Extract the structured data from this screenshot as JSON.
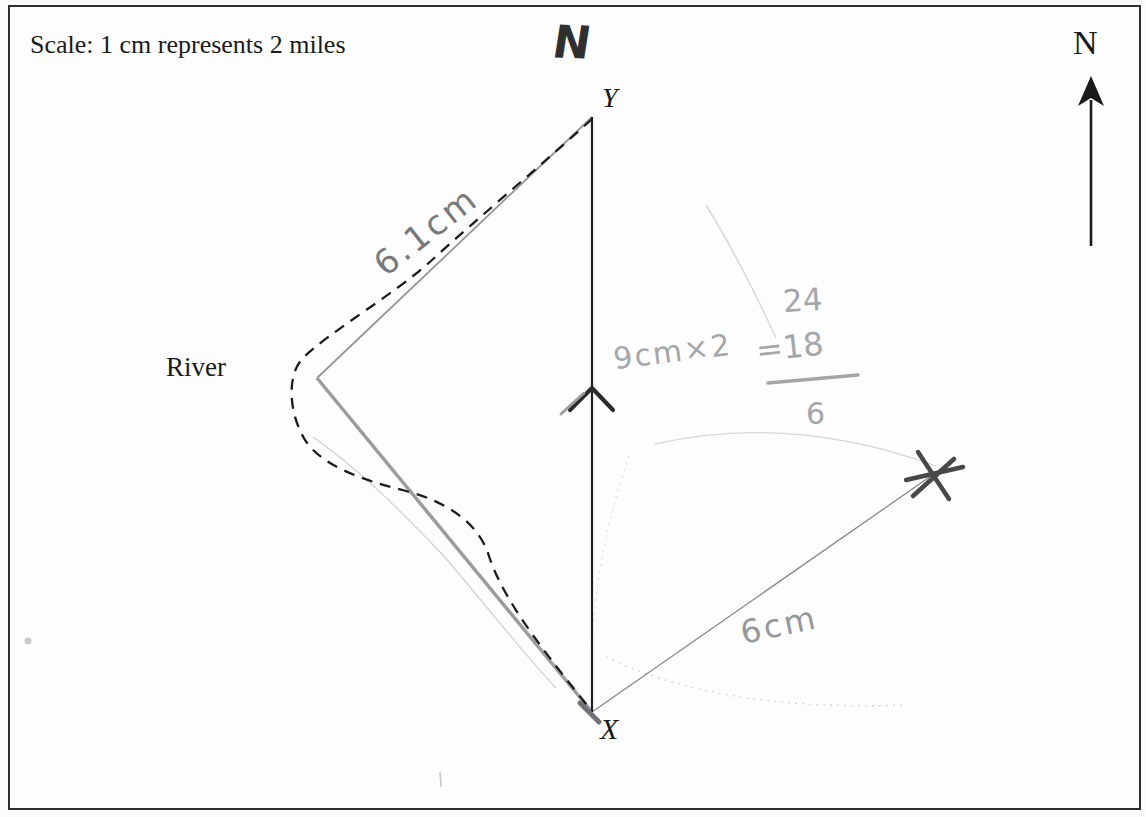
{
  "page": {
    "scale_note": "Scale: 1 cm represents 2 miles"
  },
  "compass": {
    "printed_label": "N",
    "handwritten_label": "N"
  },
  "map": {
    "point_y_label": "Y",
    "point_x_label": "X",
    "river_label": "River"
  },
  "pencil_annotations": {
    "segment_length": "6.1cm",
    "working_expression": "9cm×2",
    "working_result": "=18",
    "working_numerator": "24",
    "working_denominator": "6",
    "bearing_length": "6cm"
  },
  "colors": {
    "ink": "#1f1f1f",
    "pencil_dark": "#46484a",
    "pencil_mid": "#95989b",
    "pencil_light": "#a4a7aa",
    "pencil_faint": "#d4d6d8",
    "paper": "#fdfdfd",
    "border": "#2e2e2e"
  }
}
